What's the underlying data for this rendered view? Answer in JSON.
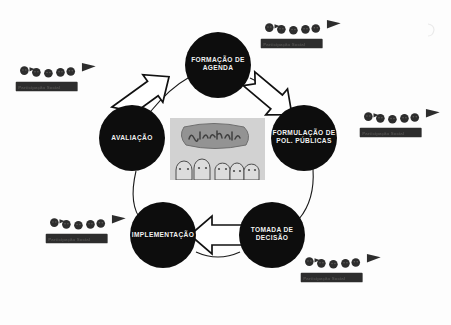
{
  "diagram": {
    "type": "policy-cycle",
    "direction": "clockwise",
    "background_color": "#fdfdfd",
    "node_color": "#0d0d0d",
    "node_text_color": "#f2f2f2",
    "arrow_fill": "#ffffff",
    "arrow_stroke": "#111111",
    "connector_color": "#1a1a1a",
    "stages": [
      {
        "id": "formacao-agenda",
        "label": "Formação de\nAgenda",
        "position": "top",
        "cx": 218,
        "cy": 65,
        "r": 33
      },
      {
        "id": "formulacao",
        "label": "Formulação de\nPol. Públicas",
        "position": "right",
        "cx": 304,
        "cy": 138,
        "r": 33
      },
      {
        "id": "tomada-decisao",
        "label": "Tomada de\nDecisão",
        "position": "bottom-right",
        "cx": 272,
        "cy": 235,
        "r": 33
      },
      {
        "id": "implementacao",
        "label": "Implementação",
        "position": "bottom-left",
        "cx": 163,
        "cy": 235,
        "r": 33
      },
      {
        "id": "avaliacao",
        "label": "Avaliação",
        "position": "left",
        "cx": 132,
        "cy": 138,
        "r": 33
      }
    ],
    "arrows": [
      {
        "id": "arrow-avaliacao-to-formacao",
        "from": "avaliacao",
        "to": "formacao-agenda"
      },
      {
        "id": "arrow-formacao-to-formulacao",
        "from": "formacao-agenda",
        "to": "formulacao"
      },
      {
        "id": "arrow-decisao-to-implementacao",
        "from": "tomada-decisao",
        "to": "implementacao"
      }
    ],
    "participation_banners": [
      {
        "id": "banner-top-left",
        "label": "Participação Social",
        "x": 14,
        "y": 56
      },
      {
        "id": "banner-top-right",
        "label": "Participação Social",
        "x": 259,
        "y": 13
      },
      {
        "id": "banner-right",
        "label": "Participação Social",
        "x": 358,
        "y": 102
      },
      {
        "id": "banner-bottom-left",
        "label": "Participação Social",
        "x": 44,
        "y": 208
      },
      {
        "id": "banner-bottom-right",
        "label": "Participação Social",
        "x": 299,
        "y": 247
      }
    ],
    "center_photo": {
      "id": "center-photo",
      "description": "Fotografia de desenho: multidão com faixa",
      "banner_word": "Democracia",
      "x": 170,
      "y": 118,
      "width": 95,
      "height": 62
    }
  }
}
